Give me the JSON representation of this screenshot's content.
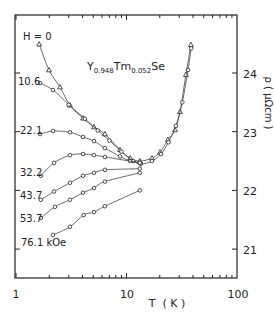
{
  "chart_data": {
    "type": "line",
    "title": "Y0.948Tm0.052Se",
    "title_parts": {
      "base1": "Y",
      "sub1": "0.948",
      "base2": "Tm",
      "sub2": "0.052",
      "base3": "Se"
    },
    "xlabel": "T  ( K )",
    "ylabel": "ρ ( μΩcm )",
    "xscale": "log",
    "xlim": [
      1,
      100
    ],
    "ylim": [
      20.5,
      25.0
    ],
    "x_ticks": [
      1,
      10,
      100
    ],
    "x_tick_labels": [
      "1",
      "10",
      "100"
    ],
    "y_ticks": [
      21,
      22,
      23,
      24
    ],
    "y_tick_labels": [
      "21",
      "22",
      "23",
      "24"
    ],
    "y_axis_side": "right",
    "grid": false,
    "legend": "inline labels at left of each curve",
    "series": [
      {
        "name": "H=0",
        "label": "H = 0",
        "marker": "triangle",
        "x": [
          1.62,
          1.99,
          2.5,
          3.08,
          4.04,
          5.08,
          6.38,
          8.74,
          10.8,
          13.2,
          17.0,
          20.1,
          23.7,
          27.5,
          30.5,
          34.5,
          38.3
        ],
        "y": [
          24.49,
          24.05,
          23.76,
          23.45,
          23.23,
          23.08,
          22.96,
          22.69,
          22.55,
          22.5,
          22.55,
          22.65,
          22.86,
          23.03,
          23.34,
          23.97,
          24.48
        ]
      },
      {
        "name": "10.6 kOe",
        "label": "10.6",
        "marker": "circle",
        "x": [
          1.65,
          2.16,
          3.0,
          4.2,
          5.5,
          7.0,
          9.0,
          11.5,
          13.5,
          17.0,
          20.5,
          24.0,
          28.0,
          32.0,
          36.0,
          38.5
        ],
        "y": [
          23.83,
          23.71,
          23.46,
          23.22,
          23.02,
          22.85,
          22.66,
          22.5,
          22.45,
          22.5,
          22.62,
          22.82,
          23.1,
          23.5,
          24.05,
          24.42
        ]
      },
      {
        "name": "22.1 kOe",
        "label": "22.1",
        "marker": "circle",
        "x": [
          1.65,
          2.16,
          3.08,
          4.04,
          5.08,
          6.38,
          8.74,
          10.8,
          13.2
        ],
        "y": [
          22.96,
          23.01,
          22.99,
          22.91,
          22.84,
          22.72,
          22.58,
          22.5,
          22.47
        ]
      },
      {
        "name": "32.2 kOe",
        "label": "32.2",
        "marker": "circle",
        "x": [
          1.68,
          2.21,
          3.08,
          4.04,
          5.08,
          6.38,
          13.2
        ],
        "y": [
          22.25,
          22.47,
          22.6,
          22.62,
          22.6,
          22.57,
          22.47
        ]
      },
      {
        "name": "43.7 kOe",
        "label": "43.7",
        "marker": "circle",
        "x": [
          1.68,
          2.21,
          3.08,
          4.04,
          5.08,
          6.38,
          13.2
        ],
        "y": [
          21.84,
          21.98,
          22.13,
          22.25,
          22.3,
          22.35,
          22.37
        ]
      },
      {
        "name": "53.7 kOe",
        "label": "53.7",
        "marker": "circle",
        "x": [
          1.68,
          2.25,
          3.08,
          4.04,
          5.08,
          6.38,
          13.2
        ],
        "y": [
          21.53,
          21.72,
          21.84,
          21.96,
          22.04,
          22.15,
          22.3
        ]
      },
      {
        "name": "76.1 kOe",
        "label": "76.1 kOe",
        "marker": "circle",
        "x": [
          2.16,
          3.08,
          4.1,
          5.08,
          6.38,
          13.2
        ],
        "y": [
          21.24,
          21.38,
          21.58,
          21.63,
          21.73,
          22.0
        ]
      }
    ]
  }
}
